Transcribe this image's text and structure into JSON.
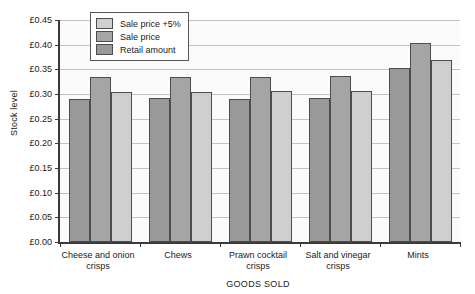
{
  "chart_data": {
    "type": "bar",
    "title": "",
    "xlabel": "GOODS SOLD",
    "ylabel": "Stock level",
    "ylim": [
      0.0,
      0.45
    ],
    "ytick_step": 0.05,
    "ytick_labels": [
      "£0.45",
      "£0.40",
      "£0.35",
      "£0.30",
      "£0.25",
      "£0.20",
      "£0.15",
      "£0.10",
      "£0.05",
      "£0.00"
    ],
    "ytick_values": [
      0.45,
      0.4,
      0.35,
      0.3,
      0.25,
      0.2,
      0.15,
      0.1,
      0.05,
      0.0
    ],
    "currency_symbol": "£",
    "grid": true,
    "grid_axis": "y",
    "legend_position": "upper-left-inside",
    "categories": [
      "Cheese and onion crisps",
      "Chews",
      "Prawn cocktail crisps",
      "Salt and vinegar crisps",
      "Mints"
    ],
    "series": [
      {
        "name": "Retail amount",
        "color": "#999999",
        "values": [
          0.29,
          0.291,
          0.289,
          0.292,
          0.352
        ]
      },
      {
        "name": "Sale price",
        "color": "#a5a5a5",
        "values": [
          0.335,
          0.335,
          0.334,
          0.336,
          0.403
        ]
      },
      {
        "name": "Sale price +5%",
        "color": "#cfcfcf",
        "values": [
          0.305,
          0.305,
          0.306,
          0.307,
          0.368
        ]
      }
    ],
    "legend_order": [
      "Sale price +5%",
      "Sale price",
      "Retail amount"
    ],
    "bar_draw_order": [
      "Retail amount",
      "Sale price",
      "Sale price +5%"
    ],
    "axis_color": "#3a3a3a",
    "grid_color": "#c2c2c2",
    "plot_background": "#fbfbfb",
    "page_background": "#ffffff"
  }
}
